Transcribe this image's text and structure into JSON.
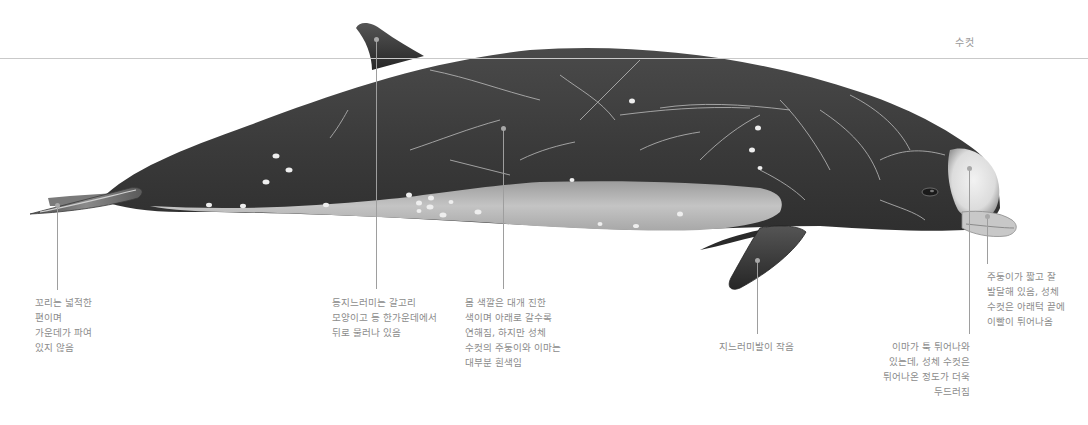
{
  "figure": {
    "sex_label": "수컷",
    "colors": {
      "body_dark": "#3d3d3d",
      "body_mid": "#555555",
      "belly_light": "#b9b9b9",
      "head_white": "#e6e6e6",
      "scar_lines": "#bdbdbd",
      "leader_line": "#9e9e9e",
      "waterline": "#c9c9c9",
      "label_text": "#8c8c8c"
    }
  },
  "callouts": [
    {
      "id": "tail",
      "lines": [
        "꼬리는 넓적한",
        "편이며",
        "가운데가 파여",
        "있지 않음"
      ]
    },
    {
      "id": "dorsal-fin",
      "lines": [
        "등지느러미는 갈고리",
        "모양이고 등 한가운데에서",
        "뒤로 물러나 있음"
      ]
    },
    {
      "id": "body-color",
      "lines": [
        "몸 색깔은 대개 진한",
        "색이며 아래로 갈수록",
        "연해짐, 하지만 성체",
        "수컷의 주둥이와 이마는",
        "대부분 흰색임"
      ]
    },
    {
      "id": "flipper",
      "lines": [
        "지느러미발이 작음"
      ]
    },
    {
      "id": "forehead",
      "lines": [
        "이마가 툭 튀어나와",
        "있는데, 성체 수컷은",
        "튀어나온 정도가 더욱",
        "두드러짐"
      ]
    },
    {
      "id": "beak",
      "lines": [
        "주둥이가 짧고 잘",
        "발달해 있음, 성체",
        "수컷은 아래턱 끝에",
        "이빨이 튀어나옴"
      ]
    }
  ]
}
